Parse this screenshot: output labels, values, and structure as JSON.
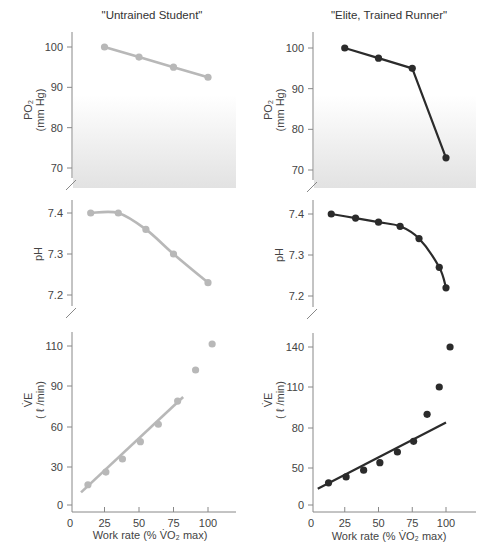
{
  "figure": {
    "left_title": "\"Untrained Student\"",
    "right_title": "\"Elite, Trained Runner\"",
    "xlabel": "Work rate (% V̇O₂ max)",
    "po2_label_line1": "PO₂",
    "po2_label_line2": "(mm Hg)",
    "ph_label": "pH",
    "ve_label_line1": "V̇E",
    "ve_label_line2": "( ℓ /min)",
    "colors": {
      "untrained": "#b8b8b8",
      "trained": "#2b2b2b",
      "shade": "#e6e6e6"
    }
  },
  "chart_data": [
    {
      "type": "line",
      "panel": "left-top",
      "title": "\"Untrained Student\"",
      "ylabel": "PO2 (mm Hg)",
      "yticks": [
        70,
        80,
        90,
        100
      ],
      "xlim": [
        0,
        110
      ],
      "ylim": [
        66,
        104
      ],
      "x": [
        25,
        50,
        75,
        100
      ],
      "values": [
        100,
        97.5,
        95,
        92.5
      ]
    },
    {
      "type": "line",
      "panel": "right-top",
      "title": "\"Elite, Trained Runner\"",
      "ylabel": "PO2 (mm Hg)",
      "yticks": [
        70,
        80,
        90,
        100
      ],
      "xlim": [
        0,
        110
      ],
      "ylim": [
        66,
        104
      ],
      "x": [
        25,
        50,
        75,
        100
      ],
      "values": [
        100,
        97.5,
        95,
        73
      ]
    },
    {
      "type": "line",
      "panel": "left-middle",
      "ylabel": "pH",
      "yticks": [
        7.2,
        7.3,
        7.4
      ],
      "xlim": [
        0,
        110
      ],
      "ylim": [
        7.17,
        7.43
      ],
      "x": [
        15,
        35,
        55,
        75,
        100
      ],
      "values": [
        7.4,
        7.4,
        7.36,
        7.3,
        7.23
      ]
    },
    {
      "type": "line",
      "panel": "right-middle",
      "ylabel": "pH",
      "yticks": [
        7.2,
        7.3,
        7.4
      ],
      "xlim": [
        0,
        110
      ],
      "ylim": [
        7.17,
        7.43
      ],
      "x": [
        15,
        33,
        50,
        66,
        80,
        95,
        100
      ],
      "values": [
        7.4,
        7.39,
        7.38,
        7.37,
        7.34,
        7.27,
        7.22
      ]
    },
    {
      "type": "scatter",
      "panel": "left-bottom",
      "ylabel": "VE (l/min)",
      "xlabel": "Work rate (% VO2 max)",
      "xticks": [
        0,
        25,
        50,
        75,
        100
      ],
      "yticks": [
        0,
        30,
        60,
        90,
        110
      ],
      "xlim": [
        0,
        115
      ],
      "ylim": [
        0,
        118
      ],
      "x": [
        13,
        26,
        38,
        51,
        64,
        78,
        91,
        103
      ],
      "values": [
        16,
        26,
        36,
        49,
        62,
        79,
        98,
        111
      ],
      "fit_line": {
        "x": [
          8,
          82
        ],
        "y": [
          10,
          82
        ]
      }
    },
    {
      "type": "scatter",
      "panel": "right-bottom",
      "ylabel": "VE (l/min)",
      "xlabel": "Work rate (% VO2 max)",
      "xticks": [
        0,
        25,
        50,
        75,
        100
      ],
      "yticks": [
        0,
        50,
        80,
        110,
        140
      ],
      "xlim": [
        0,
        115
      ],
      "ylim": [
        0,
        150
      ],
      "x": [
        13,
        26,
        39,
        51,
        64,
        76,
        86,
        95,
        103
      ],
      "values": [
        30,
        38,
        47,
        54,
        62,
        70,
        90,
        110,
        140
      ],
      "fit_line": {
        "x": [
          5,
          100
        ],
        "y": [
          22,
          84
        ]
      }
    }
  ]
}
